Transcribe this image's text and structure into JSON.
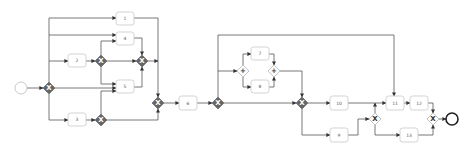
{
  "diagram": {
    "type": "bpmn-process",
    "colors": {
      "edge": "#555555",
      "task_border": "#c8c8c8",
      "gateway_dark": "#666666",
      "end_event": "#222222"
    },
    "start_event": {
      "x": 21,
      "y": 88,
      "r": 6
    },
    "end_event": {
      "x": 452,
      "y": 119,
      "r": 6
    },
    "tasks": [
      {
        "id": "1",
        "label": "1",
        "x": 116,
        "y": 12,
        "w": 18,
        "h": 13
      },
      {
        "id": "4",
        "label": "4",
        "x": 116,
        "y": 32,
        "w": 18,
        "h": 13
      },
      {
        "id": "2",
        "label": "2",
        "x": 68,
        "y": 54,
        "w": 18,
        "h": 13
      },
      {
        "id": "5",
        "label": "5",
        "x": 116,
        "y": 80,
        "w": 18,
        "h": 13
      },
      {
        "id": "3",
        "label": "3",
        "x": 68,
        "y": 113,
        "w": 18,
        "h": 13
      },
      {
        "id": "6",
        "label": "6",
        "x": 179,
        "y": 96,
        "w": 18,
        "h": 14
      },
      {
        "id": "7",
        "label": "7",
        "x": 251,
        "y": 47,
        "w": 18,
        "h": 13
      },
      {
        "id": "8",
        "label": "8",
        "x": 251,
        "y": 80,
        "w": 18,
        "h": 13
      },
      {
        "id": "10",
        "label": "10",
        "x": 330,
        "y": 96,
        "w": 18,
        "h": 14
      },
      {
        "id": "9",
        "label": "9",
        "x": 330,
        "y": 128,
        "w": 18,
        "h": 14
      },
      {
        "id": "11",
        "label": "11",
        "x": 386,
        "y": 96,
        "w": 18,
        "h": 14
      },
      {
        "id": "12",
        "label": "12",
        "x": 410,
        "y": 96,
        "w": 18,
        "h": 14
      },
      {
        "id": "13",
        "label": "13",
        "x": 400,
        "y": 128,
        "w": 18,
        "h": 14
      }
    ],
    "gateways": [
      {
        "id": "g1",
        "kind": "exclusive",
        "style": "dark",
        "symbol": "X",
        "x": 49,
        "y": 88
      },
      {
        "id": "g2",
        "kind": "exclusive",
        "style": "dark",
        "symbol": "X",
        "x": 101,
        "y": 61
      },
      {
        "id": "g3",
        "kind": "exclusive",
        "style": "dark",
        "symbol": "X",
        "x": 142,
        "y": 61
      },
      {
        "id": "g4",
        "kind": "exclusive",
        "style": "dark",
        "symbol": "X",
        "x": 101,
        "y": 120
      },
      {
        "id": "g5",
        "kind": "exclusive",
        "style": "dark",
        "symbol": "X",
        "x": 158,
        "y": 103
      },
      {
        "id": "g6",
        "kind": "exclusive",
        "style": "dark",
        "symbol": "X",
        "x": 218,
        "y": 103
      },
      {
        "id": "g7",
        "kind": "parallel",
        "style": "light",
        "symbol": "+",
        "x": 243,
        "y": 71
      },
      {
        "id": "g8",
        "kind": "parallel",
        "style": "light",
        "symbol": "+",
        "x": 274,
        "y": 71
      },
      {
        "id": "g9",
        "kind": "exclusive",
        "style": "dark",
        "symbol": "X",
        "x": 302,
        "y": 103
      },
      {
        "id": "g10",
        "kind": "exclusive",
        "style": "light",
        "symbol": "X",
        "x": 375,
        "y": 119
      },
      {
        "id": "g11",
        "kind": "exclusive",
        "style": "light",
        "symbol": "X",
        "x": 433,
        "y": 119
      }
    ],
    "edges": [
      {
        "from": "start",
        "to": "g1",
        "points": [
          [
            27,
            88
          ],
          [
            43,
            88
          ]
        ]
      },
      {
        "from": "g1",
        "to": "1",
        "points": [
          [
            49,
            82
          ],
          [
            49,
            18
          ],
          [
            116,
            18
          ]
        ]
      },
      {
        "from": "g1",
        "to": "4",
        "points": [
          [
            49,
            35
          ],
          [
            116,
            35
          ]
        ]
      },
      {
        "from": "g1",
        "to": "2",
        "points": [
          [
            49,
            61
          ],
          [
            68,
            61
          ]
        ]
      },
      {
        "from": "g1",
        "to": "5",
        "points": [
          [
            55,
            88
          ],
          [
            116,
            88
          ]
        ]
      },
      {
        "from": "g1",
        "to": "3",
        "points": [
          [
            49,
            94
          ],
          [
            49,
            120
          ],
          [
            68,
            120
          ]
        ]
      },
      {
        "from": "2",
        "to": "g2",
        "points": [
          [
            86,
            61
          ],
          [
            95,
            61
          ]
        ]
      },
      {
        "from": "g2",
        "to": "4",
        "points": [
          [
            101,
            55
          ],
          [
            101,
            41
          ],
          [
            116,
            41
          ]
        ]
      },
      {
        "from": "g2",
        "to": "g3",
        "points": [
          [
            107,
            61
          ],
          [
            136,
            61
          ]
        ]
      },
      {
        "from": "g2",
        "to": "5",
        "points": [
          [
            101,
            67
          ],
          [
            101,
            84
          ],
          [
            116,
            84
          ]
        ]
      },
      {
        "from": "3",
        "to": "g4",
        "points": [
          [
            86,
            120
          ],
          [
            95,
            120
          ]
        ]
      },
      {
        "from": "g4",
        "to": "5",
        "points": [
          [
            101,
            114
          ],
          [
            101,
            91
          ],
          [
            116,
            91
          ]
        ]
      },
      {
        "from": "4",
        "to": "g3",
        "points": [
          [
            134,
            38
          ],
          [
            142,
            38
          ],
          [
            142,
            55
          ]
        ]
      },
      {
        "from": "5",
        "to": "g3",
        "points": [
          [
            134,
            87
          ],
          [
            142,
            87
          ],
          [
            142,
            67
          ]
        ]
      },
      {
        "from": "1",
        "to": "g5",
        "points": [
          [
            134,
            18
          ],
          [
            158,
            18
          ],
          [
            158,
            97
          ]
        ]
      },
      {
        "from": "g3",
        "to": "g5",
        "points": [
          [
            148,
            61
          ],
          [
            158,
            61
          ]
        ]
      },
      {
        "from": "g4",
        "to": "g5",
        "points": [
          [
            107,
            120
          ],
          [
            158,
            120
          ],
          [
            158,
            109
          ]
        ]
      },
      {
        "from": "g5",
        "to": "6",
        "points": [
          [
            164,
            103
          ],
          [
            179,
            103
          ]
        ]
      },
      {
        "from": "6",
        "to": "g6",
        "points": [
          [
            197,
            103
          ],
          [
            212,
            103
          ]
        ]
      },
      {
        "from": "g6",
        "to": "11",
        "points": [
          [
            218,
            97
          ],
          [
            218,
            35
          ],
          [
            394,
            35
          ],
          [
            394,
            96
          ]
        ]
      },
      {
        "from": "g6",
        "to": "g7",
        "points": [
          [
            218,
            71
          ],
          [
            237,
            71
          ]
        ]
      },
      {
        "from": "g7",
        "to": "7",
        "points": [
          [
            243,
            65
          ],
          [
            243,
            54
          ],
          [
            251,
            54
          ]
        ]
      },
      {
        "from": "g7",
        "to": "8",
        "points": [
          [
            243,
            77
          ],
          [
            243,
            87
          ],
          [
            251,
            87
          ]
        ]
      },
      {
        "from": "7",
        "to": "g8",
        "points": [
          [
            269,
            54
          ],
          [
            274,
            54
          ],
          [
            274,
            65
          ]
        ]
      },
      {
        "from": "8",
        "to": "g8",
        "points": [
          [
            269,
            87
          ],
          [
            274,
            87
          ],
          [
            274,
            77
          ]
        ]
      },
      {
        "from": "g8",
        "to": "g9",
        "points": [
          [
            280,
            71
          ],
          [
            302,
            71
          ],
          [
            302,
            97
          ]
        ]
      },
      {
        "from": "g6",
        "to": "g9",
        "points": [
          [
            224,
            103
          ],
          [
            296,
            103
          ]
        ]
      },
      {
        "from": "g9",
        "to": "10",
        "points": [
          [
            308,
            103
          ],
          [
            330,
            103
          ]
        ]
      },
      {
        "from": "g9",
        "to": "9",
        "points": [
          [
            302,
            109
          ],
          [
            302,
            135
          ],
          [
            330,
            135
          ]
        ]
      },
      {
        "from": "10",
        "to": "11",
        "points": [
          [
            348,
            103
          ],
          [
            386,
            103
          ]
        ]
      },
      {
        "from": "9",
        "to": "g10",
        "points": [
          [
            348,
            135
          ],
          [
            358,
            135
          ],
          [
            358,
            119
          ],
          [
            369,
            119
          ]
        ]
      },
      {
        "from": "g10",
        "to": "11",
        "points": [
          [
            375,
            113
          ],
          [
            375,
            103
          ]
        ]
      },
      {
        "from": "g10",
        "to": "13",
        "points": [
          [
            375,
            125
          ],
          [
            375,
            135
          ],
          [
            400,
            135
          ]
        ]
      },
      {
        "from": "11",
        "to": "12",
        "points": [
          [
            404,
            103
          ],
          [
            410,
            103
          ]
        ]
      },
      {
        "from": "12",
        "to": "g11",
        "points": [
          [
            428,
            103
          ],
          [
            433,
            103
          ],
          [
            433,
            113
          ]
        ]
      },
      {
        "from": "13",
        "to": "g11",
        "points": [
          [
            418,
            135
          ],
          [
            433,
            135
          ],
          [
            433,
            125
          ]
        ]
      },
      {
        "from": "g11",
        "to": "end",
        "points": [
          [
            439,
            119
          ],
          [
            446,
            119
          ]
        ]
      }
    ]
  }
}
